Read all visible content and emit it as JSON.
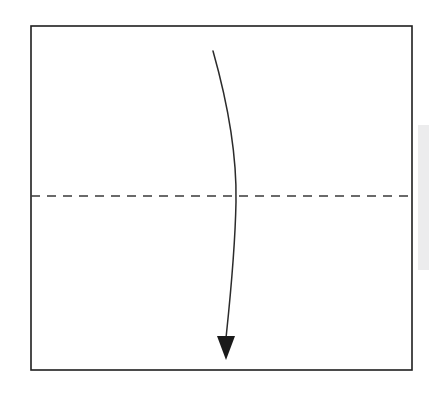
{
  "figure": {
    "title": "Curved downward arrow crossing a dashed horizontal centerline inside a rectangular frame",
    "background_color": "#ffffff",
    "width": 429,
    "height": 399
  },
  "frame": {
    "name": "rectangular-border",
    "x": 31,
    "y": 26,
    "width": 381,
    "height": 344,
    "stroke_color": "#1f1f1f",
    "stroke_width": 1.6,
    "fill": "none"
  },
  "centerline": {
    "name": "horizontal-dashed-centerline",
    "y": 196,
    "x_start": 31,
    "x_end": 412,
    "stroke_color": "#3a3a3a",
    "stroke_width": 1.5,
    "dash_length": 9,
    "gap_length": 7
  },
  "arrow": {
    "name": "curved-downward-arrow",
    "stroke_color": "#2b2b2b",
    "stroke_width": 1.5,
    "fill": "none",
    "path": "M 213 51 C 228 104 237 152 236 202 C 235 254 230 300 226 338",
    "start_point": {
      "x": 213,
      "y": 51
    },
    "end_point": {
      "x": 226,
      "y": 338
    },
    "max_right_x": 236,
    "crosses_centerline_at_x": 235,
    "direction": "downward"
  },
  "arrowhead": {
    "name": "arrowhead-triangle",
    "points": "217,336 235,336 226,360",
    "tip": {
      "x": 226,
      "y": 360
    },
    "width": 18,
    "height": 24,
    "fill_color": "#1a1a1a"
  },
  "scan_artifact": {
    "name": "right-edge-gray-band",
    "x": 418,
    "y": 125,
    "width": 11,
    "height": 145,
    "color": "#ececed"
  }
}
